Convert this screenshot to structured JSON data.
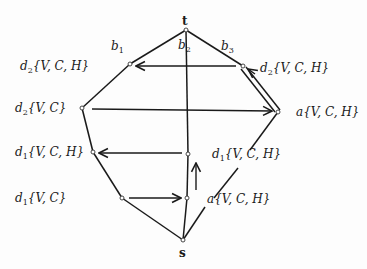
{
  "diagram": {
    "top_node": "t",
    "bottom_node": "s",
    "edge_labels": {
      "b1": {
        "base": "b",
        "sub": "1"
      },
      "b2": {
        "base": "b",
        "sub": "2"
      },
      "b3": {
        "base": "b",
        "sub": "3"
      }
    },
    "vertex_labels": [
      {
        "id": "left1",
        "prefix": "d",
        "sub": "2",
        "set": "{V, C, H}"
      },
      {
        "id": "right1",
        "prefix": "d",
        "sub": "2",
        "set": "{V, C, H}"
      },
      {
        "id": "left2",
        "prefix": "d",
        "sub": "2",
        "set": "{V, C}"
      },
      {
        "id": "right2",
        "prefix": "a",
        "sub": "",
        "set": "{V, C, H}"
      },
      {
        "id": "left3",
        "prefix": "d",
        "sub": "1",
        "set": "{V, C, H}"
      },
      {
        "id": "center1",
        "prefix": "d",
        "sub": "1",
        "set": "{V, C, H}"
      },
      {
        "id": "left4",
        "prefix": "d",
        "sub": "1",
        "set": "{V, C}"
      },
      {
        "id": "center2",
        "prefix": "a",
        "sub": "",
        "set": "{V, C, H}"
      }
    ]
  }
}
